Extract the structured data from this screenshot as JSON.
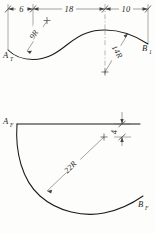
{
  "drawing": {
    "title": "Two-view orthographic drawing of a curved part",
    "line_color": "#1a1a1a",
    "dim_color": "#555555",
    "background": "#fdfdfb"
  },
  "top_view": {
    "name": "top-view",
    "point_a": {
      "letter": "A",
      "subscript": "T"
    },
    "point_b": {
      "letter": "B",
      "subscript": "1"
    },
    "dimensions": [
      {
        "label": "6",
        "name": "dim-6"
      },
      {
        "label": "18",
        "name": "dim-18"
      },
      {
        "label": "10",
        "name": "dim-10"
      }
    ],
    "radii": [
      {
        "label": "9R",
        "name": "radius-9r"
      },
      {
        "label": "14R",
        "name": "radius-14r"
      }
    ]
  },
  "front_view": {
    "name": "front-view",
    "point_a": {
      "letter": "A",
      "subscript": "F"
    },
    "point_b": {
      "letter": "B",
      "subscript": "F"
    },
    "radii": [
      {
        "label": "22R",
        "name": "radius-22r"
      }
    ],
    "dimensions": [
      {
        "label": "4",
        "name": "dim-4"
      }
    ]
  }
}
